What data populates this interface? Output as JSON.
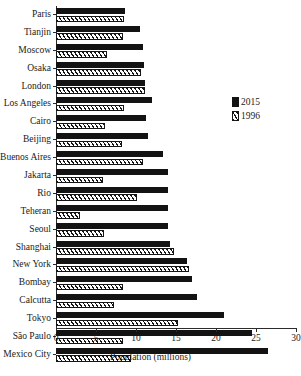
{
  "chart_data": {
    "type": "bar",
    "orientation": "horizontal",
    "title": "",
    "xlabel": "Population (millions)",
    "ylabel": "",
    "xlim": [
      0,
      30
    ],
    "xticks": [
      0,
      5,
      10,
      15,
      20,
      25,
      30
    ],
    "grid": false,
    "legend_position": "right",
    "categories": [
      "Paris",
      "Tianjin",
      "Moscow",
      "Osaka",
      "London",
      "Los Angeles",
      "Cairo",
      "Beijing",
      "Buenos Aires",
      "Jakarta",
      "Rio",
      "Teheran",
      "Seoul",
      "Shanghai",
      "New York",
      "Bombay",
      "Calcutta",
      "Tokyo",
      "São Paulo",
      "Mexico City"
    ],
    "series": [
      {
        "name": "2015",
        "values": [
          8.6,
          10.5,
          10.9,
          11.0,
          11.1,
          12.0,
          11.2,
          11.5,
          13.4,
          14.0,
          14.0,
          14.0,
          14.0,
          14.3,
          16.4,
          17.0,
          17.6,
          21.0,
          24.5,
          26.5
        ]
      },
      {
        "name": "1996",
        "values": [
          8.5,
          8.4,
          6.4,
          10.6,
          11.1,
          8.5,
          6.1,
          8.3,
          10.9,
          5.9,
          10.1,
          3.0,
          6.0,
          14.8,
          16.6,
          8.4,
          7.3,
          15.3,
          8.4,
          9.4
        ]
      }
    ]
  },
  "legend": {
    "entries": [
      {
        "label": "2015",
        "style": "solid",
        "color": "#131313"
      },
      {
        "label": "1996",
        "style": "hatched",
        "color": "#151515"
      }
    ]
  }
}
